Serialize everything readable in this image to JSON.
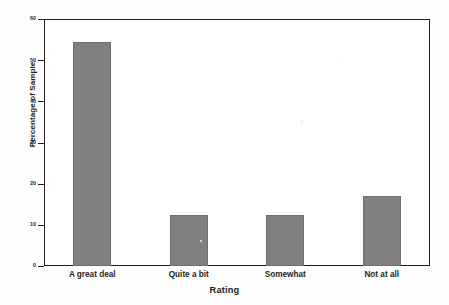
{
  "chart_data": {
    "type": "bar",
    "title": "",
    "xlabel": "Rating",
    "ylabel": "Percentage of Sample",
    "categories": [
      "A great deal",
      "Quite a bit",
      "Somewhat",
      "Not at all"
    ],
    "values": [
      54.5,
      12.5,
      12.5,
      17.0
    ],
    "ylim": [
      0,
      60
    ],
    "yticks": [
      0,
      10,
      20,
      30,
      40,
      50,
      60
    ],
    "ytick_labels": [
      "0",
      "10",
      "20",
      "30",
      "40",
      "50",
      "60"
    ],
    "grid": false,
    "legend": null,
    "series": [
      {
        "name": "Percentage of Sample",
        "values": [
          54.5,
          12.5,
          12.5,
          17.0
        ]
      }
    ],
    "bar_color": "#808080",
    "bar_edge_color": "#6e6e6e",
    "axis_color": "#231f20",
    "background_color": "#ffffff"
  }
}
